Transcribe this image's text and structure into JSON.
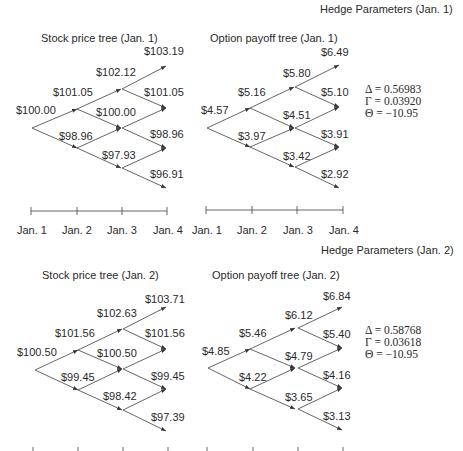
{
  "sections": [
    {
      "hedge_title": "Hedge Parameters (Jan. 1)",
      "stock_title": "Stock price tree (Jan. 1)",
      "option_title": "Option payoff tree (Jan. 1)",
      "stock": {
        "l0": [
          "$100.00"
        ],
        "l1": [
          "$101.05",
          "$98.96"
        ],
        "l2": [
          "$102.12",
          "$100.00",
          "$97.93"
        ],
        "l3": [
          "$103.19",
          "$101.05",
          "$98.96",
          "$96.91"
        ]
      },
      "option": {
        "l0": [
          "$4.57"
        ],
        "l1": [
          "$5.16",
          "$3.97"
        ],
        "l2": [
          "$5.80",
          "$4.51",
          "$3.42"
        ],
        "l3": [
          "$6.49",
          "$5.10",
          "$3.91",
          "$2.92"
        ]
      },
      "greeks": {
        "delta": "Δ = 0.56983",
        "gamma": "Γ = 0.03920",
        "theta": "Θ = −10.95"
      },
      "axis_labels": [
        "Jan. 1",
        "Jan. 2",
        "Jan. 3",
        "Jan. 4"
      ]
    },
    {
      "hedge_title": "Hedge Parameters (Jan. 2)",
      "stock_title": "Stock price tree (Jan. 2)",
      "option_title": "Option payoff tree (Jan. 2)",
      "stock": {
        "l0": [
          "$100.50"
        ],
        "l1": [
          "$101.56",
          "$99.45"
        ],
        "l2": [
          "$102.63",
          "$100.50",
          "$98.42"
        ],
        "l3": [
          "$103.71",
          "$101.56",
          "$99.45",
          "$97.39"
        ]
      },
      "option": {
        "l0": [
          "$4.85"
        ],
        "l1": [
          "$5.46",
          "$4.22"
        ],
        "l2": [
          "$6.12",
          "$4.79",
          "$3.65"
        ],
        "l3": [
          "$6.84",
          "$5.40",
          "$4.16",
          "$3.13"
        ]
      },
      "greeks": {
        "delta": "Δ = 0.58768",
        "gamma": "Γ = 0.03618",
        "theta": "Θ = −10.95"
      },
      "axis_labels": []
    }
  ]
}
